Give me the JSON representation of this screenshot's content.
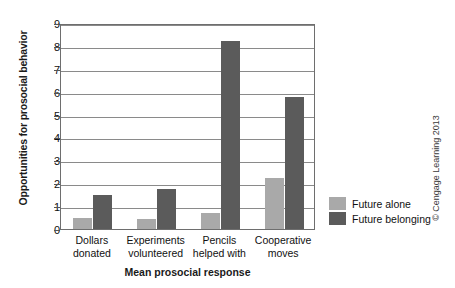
{
  "chart_data": {
    "type": "bar",
    "title": "",
    "xlabel": "Mean prosocial response",
    "ylabel": "Opportunities for prosocial behavior",
    "ylim": [
      0,
      9
    ],
    "yticks": [
      0,
      1,
      2,
      3,
      4,
      5,
      6,
      7,
      8,
      9
    ],
    "grid": true,
    "legend_position": "right",
    "categories": [
      "Dollars donated",
      "Experiments volunteered",
      "Pencils helped with",
      "Cooperative moves"
    ],
    "category_lines": [
      [
        "Dollars",
        "donated"
      ],
      [
        "Experiments",
        "volunteered"
      ],
      [
        "Pencils",
        "helped with"
      ],
      [
        "Cooperative",
        "moves"
      ]
    ],
    "series": [
      {
        "name": "Future alone",
        "color": "#a9a9a9",
        "values": [
          0.5,
          0.45,
          0.7,
          2.25
        ]
      },
      {
        "name": "Future belonging",
        "color": "#5b5b5b",
        "values": [
          1.5,
          1.75,
          8.2,
          5.75
        ]
      }
    ]
  },
  "credit": "© Cengage Learning 2013"
}
